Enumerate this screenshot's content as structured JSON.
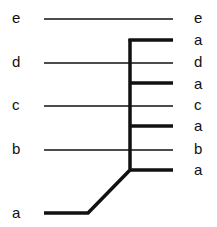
{
  "diagram": {
    "left_labels": [
      {
        "text": "e",
        "y": 18
      },
      {
        "text": "d",
        "y": 62
      },
      {
        "text": "c",
        "y": 105
      },
      {
        "text": "b",
        "y": 149
      },
      {
        "text": "a",
        "y": 213
      }
    ],
    "right_labels": [
      {
        "text": "e",
        "y": 18
      },
      {
        "text": "a",
        "y": 40
      },
      {
        "text": "d",
        "y": 62
      },
      {
        "text": "a",
        "y": 84
      },
      {
        "text": "c",
        "y": 105
      },
      {
        "text": "a",
        "y": 126
      },
      {
        "text": "b",
        "y": 149
      },
      {
        "text": "a",
        "y": 170
      }
    ],
    "thin_lines": [
      {
        "from": "e",
        "to": "e",
        "y": 19
      },
      {
        "from": "d",
        "to": "d",
        "y": 63
      },
      {
        "from": "c",
        "to": "c",
        "y": 106
      },
      {
        "from": "b",
        "to": "b",
        "y": 150
      }
    ],
    "thick_branch": {
      "source": "a",
      "targets": [
        "a",
        "a",
        "a",
        "a"
      ],
      "target_ys": [
        40,
        83,
        126,
        170
      ]
    },
    "colors": {
      "line": "#111111",
      "background": "#ffffff"
    }
  }
}
